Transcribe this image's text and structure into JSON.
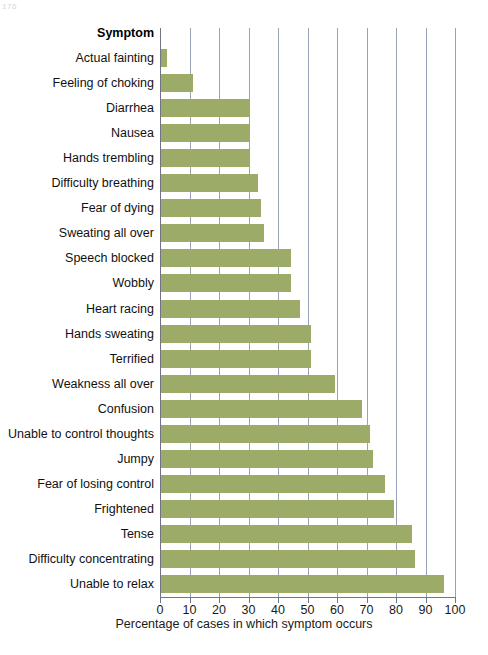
{
  "artifact": {
    "corner_mark": "176"
  },
  "chart_data": {
    "type": "bar",
    "orientation": "horizontal",
    "title": "",
    "xlabel": "Percentage of cases in which symptom occurs",
    "ylabel": "Symptom",
    "column_header": "Symptom",
    "xlim": [
      0,
      100
    ],
    "xticks": [
      0,
      10,
      20,
      30,
      40,
      50,
      60,
      70,
      80,
      90,
      100
    ],
    "xticklabels": [
      "0",
      "10",
      "20",
      "30",
      "40",
      "50",
      "60",
      "70",
      "80",
      "90",
      "100"
    ],
    "grid": "vertical",
    "legend": "none",
    "bar_color": "#9cab68",
    "gridline_color": "#9aa3b5",
    "categories": [
      "Actual fainting",
      "Feeling of choking",
      "Diarrhea",
      "Nausea",
      "Hands trembling",
      "Difficulty breathing",
      "Fear of dying",
      "Sweating all over",
      "Speech blocked",
      "Wobbly",
      "Heart racing",
      "Hands sweating",
      "Terrified",
      "Weakness all over",
      "Confusion",
      "Unable to control thoughts",
      "Jumpy",
      "Fear of losing control",
      "Frightened",
      "Tense",
      "Difficulty concentrating",
      "Unable to relax"
    ],
    "values": [
      2,
      11,
      30,
      30,
      30,
      33,
      34,
      35,
      44,
      44,
      47,
      51,
      51,
      59,
      68,
      71,
      72,
      76,
      79,
      85,
      86,
      96
    ]
  }
}
